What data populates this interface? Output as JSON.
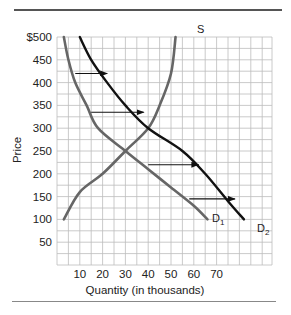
{
  "chart_data": {
    "type": "line",
    "title": "",
    "xlabel": "Quantity (in thousands)",
    "ylabel": "Price",
    "xlim": [
      0,
      95
    ],
    "ylim": [
      0,
      500
    ],
    "grid": true,
    "x_ticks": [
      "10",
      "20",
      "30",
      "40",
      "50",
      "60",
      "70"
    ],
    "y_ticks": [
      "$500",
      "450",
      "400",
      "350",
      "300",
      "250",
      "200",
      "150",
      "100",
      "50"
    ],
    "series": [
      {
        "name": "S",
        "color": "#666666",
        "points": [
          [
            3,
            100
          ],
          [
            10,
            160
          ],
          [
            20,
            200
          ],
          [
            30,
            250
          ],
          [
            40,
            300
          ],
          [
            45,
            350
          ],
          [
            50,
            420
          ],
          [
            52,
            500
          ]
        ]
      },
      {
        "name": "D1",
        "color": "#666666",
        "points": [
          [
            3,
            500
          ],
          [
            5,
            450
          ],
          [
            8,
            400
          ],
          [
            13,
            350
          ],
          [
            18,
            300
          ],
          [
            30,
            250
          ],
          [
            40,
            210
          ],
          [
            50,
            170
          ],
          [
            60,
            130
          ],
          [
            66,
            100
          ]
        ]
      },
      {
        "name": "D2",
        "color": "#111111",
        "points": [
          [
            10,
            500
          ],
          [
            15,
            450
          ],
          [
            22,
            400
          ],
          [
            30,
            350
          ],
          [
            40,
            300
          ],
          [
            55,
            250
          ],
          [
            65,
            200
          ],
          [
            75,
            140
          ],
          [
            82,
            100
          ]
        ]
      }
    ],
    "annotations": [
      {
        "type": "arrow",
        "from": [
          8,
          420
        ],
        "to": [
          22,
          420
        ]
      },
      {
        "type": "arrow",
        "from": [
          15,
          335
        ],
        "to": [
          38,
          335
        ]
      },
      {
        "type": "arrow",
        "from": [
          40,
          220
        ],
        "to": [
          62,
          220
        ]
      },
      {
        "type": "arrow",
        "from": [
          58,
          145
        ],
        "to": [
          78,
          145
        ]
      }
    ]
  },
  "labels": {
    "s": "S",
    "d1_main": "D",
    "d1_sub": "1",
    "d2_main": "D",
    "d2_sub": "2"
  }
}
